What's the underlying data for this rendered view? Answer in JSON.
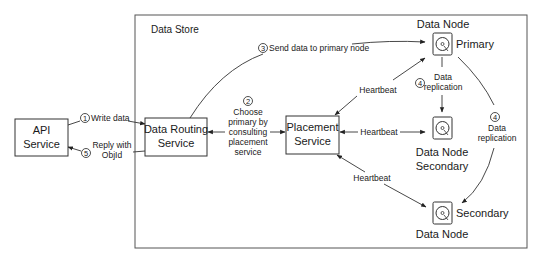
{
  "diagram": {
    "container": {
      "label": "Data Store"
    },
    "nodes": {
      "api": {
        "line1": "API",
        "line2": "Service"
      },
      "routing": {
        "line1": "Data Routing",
        "line2": "Service"
      },
      "placement": {
        "line1": "Placement",
        "line2": "Service"
      },
      "primary": {
        "title": "Data Node",
        "role": "Primary",
        "icon": "hard-disk-icon"
      },
      "secondary1": {
        "line1": "Data Node",
        "line2": "Secondary",
        "icon": "hard-disk-icon"
      },
      "secondary2": {
        "role": "Secondary",
        "title": "Data Node",
        "icon": "hard-disk-icon"
      }
    },
    "edges": {
      "write": {
        "step": "1",
        "label": "Write data"
      },
      "reply": {
        "step": "5",
        "line1": "Reply with",
        "line2": "ObjId"
      },
      "choose": {
        "step": "2",
        "lines": [
          "Choose",
          "primary by",
          "consulting",
          "placement",
          "service"
        ]
      },
      "send": {
        "step": "3",
        "label": "Send data to primary node"
      },
      "hb_primary": {
        "label": "Heartbeat"
      },
      "hb_secondary1": {
        "label": "Heartbeat"
      },
      "hb_secondary2": {
        "label": "Heartbeat"
      },
      "repl1": {
        "step": "4",
        "line1": "Data",
        "line2": "replication"
      },
      "repl2": {
        "step": "4",
        "line1": "Data",
        "line2": "replication"
      }
    }
  }
}
